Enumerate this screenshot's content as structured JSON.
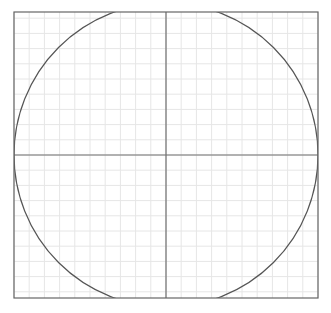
{
  "diagram": {
    "type": "circle-on-grid",
    "frame": {
      "x": 14,
      "y": 12,
      "width": 304,
      "height": 286,
      "stroke": "#666666"
    },
    "grid": {
      "spacing": 15.2,
      "color": "#e6e6e6"
    },
    "axes": {
      "cx": 166,
      "cy": 155,
      "color": "#707070"
    },
    "circle": {
      "cx": 166,
      "cy": 155,
      "r": 152,
      "stroke": "#555555"
    }
  }
}
